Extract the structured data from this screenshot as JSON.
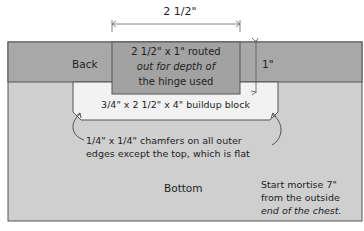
{
  "diagram": {
    "top_dimension": "2 1/2\"",
    "side_dimension": "1\"",
    "back_label": "Back",
    "bottom_label": "Bottom",
    "routed_note": [
      "2 1/2\" x 1\" routed",
      "out for depth of",
      "the hinge used"
    ],
    "block_label": "3/4\" x 2 1/2\" x 4\" buildup block",
    "chamfer_note": [
      "1/4\" x 1/4\" chamfers on all outer",
      "edges except the top, which is flat"
    ],
    "mortise_note": [
      "Start mortise 7\"",
      "from  the outside",
      "end of the chest."
    ],
    "colors": {
      "back_band": "#a8a8a8",
      "bottom_area": "#cfcfcf",
      "routed_area": "#a2a2a2",
      "block": "#f2f2f2",
      "outline": "#555555"
    }
  }
}
